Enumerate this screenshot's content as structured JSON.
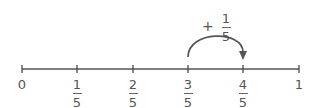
{
  "diagram": {
    "type": "number-line",
    "color": "#555555",
    "jump_label": {
      "sign": "+",
      "numerator": "1",
      "denominator": "5"
    },
    "jump": {
      "from_index": 3,
      "to_index": 4
    },
    "ticks": [
      {
        "whole": "0"
      },
      {
        "numerator": "1",
        "denominator": "5"
      },
      {
        "numerator": "2",
        "denominator": "5"
      },
      {
        "numerator": "3",
        "denominator": "5"
      },
      {
        "numerator": "4",
        "denominator": "5"
      },
      {
        "whole": "1"
      }
    ]
  }
}
